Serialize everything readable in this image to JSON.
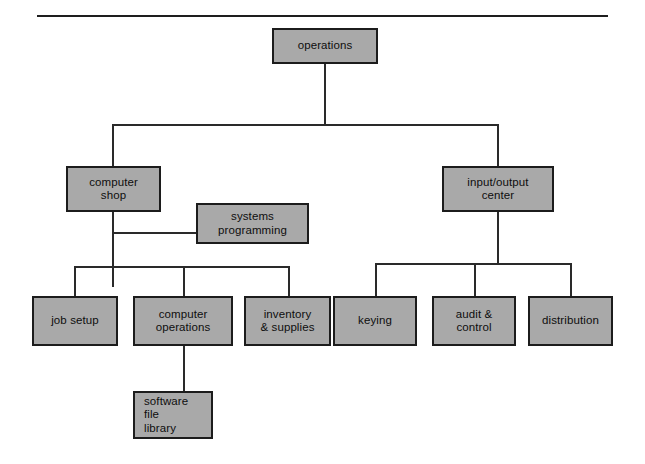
{
  "diagram": {
    "type": "org-chart",
    "colors": {
      "box_fill": "#a9a9a9",
      "box_border": "#1c1c1c",
      "connector": "#2a2a2a",
      "background": "#ffffff",
      "rule": "#1e1e1e"
    },
    "nodes": [
      {
        "id": "operations",
        "label": "operations",
        "level": 0,
        "parent": null,
        "x": 272,
        "y": 28,
        "w": 106,
        "h": 36
      },
      {
        "id": "computer-shop",
        "label": "computer\nshop",
        "level": 1,
        "parent": "operations",
        "x": 66,
        "y": 166,
        "w": 95,
        "h": 46
      },
      {
        "id": "input-output-center",
        "label": "input/output\ncenter",
        "level": 1,
        "parent": "operations",
        "x": 442,
        "y": 166,
        "w": 112,
        "h": 46
      },
      {
        "id": "systems-programming",
        "label": "systems\nprogramming",
        "level": 2,
        "parent": "computer-shop",
        "relation": "staff",
        "x": 196,
        "y": 203,
        "w": 113,
        "h": 41
      },
      {
        "id": "job-setup",
        "label": "job setup",
        "level": 2,
        "parent": "computer-shop",
        "x": 32,
        "y": 296,
        "w": 86,
        "h": 50
      },
      {
        "id": "computer-operations",
        "label": "computer\noperations",
        "level": 2,
        "parent": "computer-shop",
        "x": 133,
        "y": 296,
        "w": 100,
        "h": 50
      },
      {
        "id": "inventory-supplies",
        "label": "inventory\n& supplies",
        "level": 2,
        "parent": "computer-shop",
        "x": 244,
        "y": 296,
        "w": 87,
        "h": 50
      },
      {
        "id": "keying",
        "label": "keying",
        "level": 2,
        "parent": "input-output-center",
        "x": 333,
        "y": 296,
        "w": 84,
        "h": 50
      },
      {
        "id": "audit-control",
        "label": "audit &\ncontrol",
        "level": 2,
        "parent": "input-output-center",
        "x": 432,
        "y": 296,
        "w": 84,
        "h": 50
      },
      {
        "id": "distribution",
        "label": "distribution",
        "level": 2,
        "parent": "input-output-center",
        "x": 528,
        "y": 296,
        "w": 85,
        "h": 50
      },
      {
        "id": "software-file-library",
        "label": "software\nfile\nlibrary",
        "level": 3,
        "parent": "computer-operations",
        "align": "left",
        "x": 133,
        "y": 391,
        "w": 80,
        "h": 48
      }
    ],
    "connectors": [
      {
        "id": "operations-stem",
        "type": "v",
        "x": 324,
        "y": 64,
        "len": 60
      },
      {
        "id": "level1-bus",
        "type": "h",
        "x": 112,
        "y": 124,
        "len": 386
      },
      {
        "id": "computer-shop-drop",
        "type": "v",
        "x": 112,
        "y": 124,
        "len": 42
      },
      {
        "id": "iocenter-drop",
        "type": "v",
        "x": 497,
        "y": 124,
        "len": 42
      },
      {
        "id": "computer-shop-stem",
        "type": "v",
        "x": 112,
        "y": 212,
        "len": 75
      },
      {
        "id": "systems-prog-link",
        "type": "h",
        "x": 112,
        "y": 232,
        "len": 85
      },
      {
        "id": "computer-shop-child-bus",
        "type": "h",
        "x": 74,
        "y": 266,
        "len": 214
      },
      {
        "id": "job-setup-drop",
        "type": "v",
        "x": 74,
        "y": 266,
        "len": 30
      },
      {
        "id": "computer-ops-drop",
        "type": "v",
        "x": 183,
        "y": 266,
        "len": 30
      },
      {
        "id": "inventory-drop",
        "type": "v",
        "x": 288,
        "y": 266,
        "len": 30
      },
      {
        "id": "iocenter-stem",
        "type": "v",
        "x": 497,
        "y": 212,
        "len": 52
      },
      {
        "id": "iocenter-child-bus",
        "type": "h",
        "x": 375,
        "y": 263,
        "len": 196
      },
      {
        "id": "keying-drop",
        "type": "v",
        "x": 375,
        "y": 263,
        "len": 33
      },
      {
        "id": "audit-drop",
        "type": "v",
        "x": 474,
        "y": 263,
        "len": 33
      },
      {
        "id": "distribution-drop",
        "type": "v",
        "x": 570,
        "y": 263,
        "len": 33
      },
      {
        "id": "software-library-stem",
        "type": "v",
        "x": 183,
        "y": 346,
        "len": 45
      }
    ],
    "rule": {
      "x": 37,
      "y": 15,
      "w": 571
    }
  }
}
